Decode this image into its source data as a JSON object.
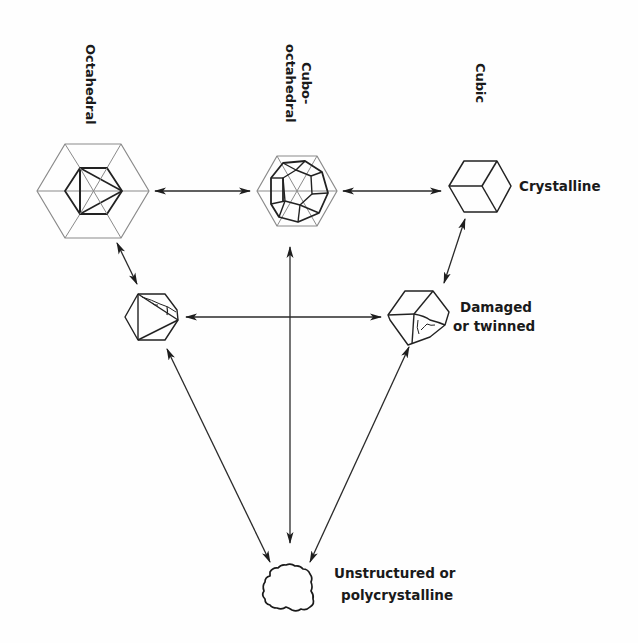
{
  "diagram": {
    "column_labels": {
      "octahedral": "Octahedral",
      "cubo_line1": "Cubo-",
      "cubo_line2": "octahedral",
      "cubic": "Cubic"
    },
    "row_labels": {
      "crystalline": "Crystalline",
      "damaged_line1": "Damaged",
      "damaged_line2": "or twinned",
      "unstructured_line1": "Unstructured or",
      "unstructured_line2": "polycrystalline"
    },
    "nodes": [
      {
        "id": "octahedral",
        "shape": "octahedron-in-hexagon",
        "x": 93,
        "y": 191
      },
      {
        "id": "cubo-octahedral",
        "shape": "cuboctahedron-in-hexagon",
        "x": 297,
        "y": 191
      },
      {
        "id": "cubic",
        "shape": "cube",
        "x": 480,
        "y": 186
      },
      {
        "id": "damaged-octahedron",
        "shape": "damaged-octahedron",
        "x": 150,
        "y": 317
      },
      {
        "id": "damaged-cube",
        "shape": "damaged-cube",
        "x": 419,
        "y": 317
      },
      {
        "id": "unstructured",
        "shape": "irregular-blob",
        "x": 286,
        "y": 585
      }
    ],
    "edges": [
      {
        "from": "octahedral",
        "to": "cubo-octahedral",
        "type": "bidirectional"
      },
      {
        "from": "cubo-octahedral",
        "to": "cubic",
        "type": "bidirectional"
      },
      {
        "from": "octahedral",
        "to": "damaged-octahedron",
        "type": "bidirectional"
      },
      {
        "from": "cubic",
        "to": "damaged-cube",
        "type": "bidirectional"
      },
      {
        "from": "damaged-octahedron",
        "to": "damaged-cube",
        "type": "bidirectional"
      },
      {
        "from": "cubo-octahedral",
        "to": "unstructured",
        "type": "bidirectional"
      },
      {
        "from": "damaged-octahedron",
        "to": "unstructured",
        "type": "bidirectional"
      },
      {
        "from": "damaged-cube",
        "to": "unstructured",
        "type": "bidirectional"
      }
    ],
    "colors": {
      "line": "#222222",
      "faint_line": "#8a8a8a",
      "text": "#1a1a1a",
      "background": "#fefefe"
    }
  }
}
